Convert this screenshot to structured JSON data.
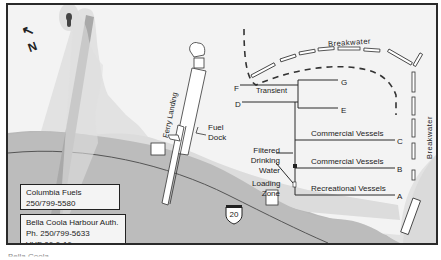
{
  "map": {
    "north_label": "N",
    "breakwater_top_label": "Breakwater",
    "breakwater_right_label": "Breakwater",
    "ferry_landing_label": "Ferry Landing",
    "fuel_dock_label": "Fuel\nDock",
    "fuel_dock_line1": "Fuel",
    "fuel_dock_line2": "Dock",
    "water_line1": "Filtered",
    "water_line2": "Drinking",
    "water_line3": "Water",
    "loading_line1": "Loading",
    "loading_line2": "Zone",
    "highway_number": "20",
    "docks": [
      {
        "letter": "G",
        "label": ""
      },
      {
        "letter": "F",
        "label": "Transient"
      },
      {
        "letter": "E",
        "label": ""
      },
      {
        "letter": "D",
        "label": ""
      },
      {
        "letter": "C",
        "label": "Commercial Vessels"
      },
      {
        "letter": "B",
        "label": "Commercial Vessels"
      },
      {
        "letter": "A",
        "label": "Recreational Vessels"
      }
    ],
    "colors": {
      "water": "#f3f3f3",
      "shore_light": "#dcdcdc",
      "land": "#b9b9b9",
      "line": "#2a2a2a"
    }
  },
  "contacts": [
    {
      "line1": "Columbia Fuels",
      "line2": "250/799-5580"
    },
    {
      "line1": "Bella Coola Harbour Auth.",
      "line2": "Ph. 250/799-5633",
      "line3": "VHF 06 & 16"
    }
  ],
  "caption": "Bella Coola"
}
